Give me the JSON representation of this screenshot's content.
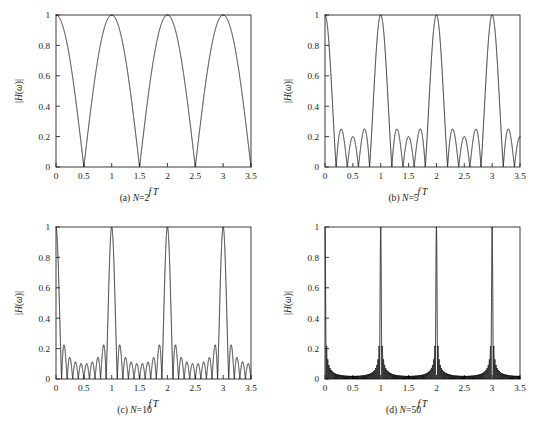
{
  "figure": {
    "panels": [
      {
        "id": "panel-a",
        "caption_prefix": "(a) ",
        "caption_symbol": "N",
        "caption_value": "=2",
        "N": 2
      },
      {
        "id": "panel-b",
        "caption_prefix": "(b) ",
        "caption_symbol": "N",
        "caption_value": "=5",
        "N": 5
      },
      {
        "id": "panel-c",
        "caption_prefix": "(c) ",
        "caption_symbol": "N",
        "caption_value": "=10",
        "N": 10
      },
      {
        "id": "panel-d",
        "caption_prefix": "(d) ",
        "caption_symbol": "N",
        "caption_value": "=50",
        "N": 50
      }
    ]
  },
  "axis": {
    "xlabel": "f T",
    "xlabel_f": "f",
    "xlabel_T": "T",
    "ylabel": "|H(ω)|",
    "ylabel_bar": "|",
    "ylabel_H": "H",
    "ylabel_paren_open": "(",
    "ylabel_omega": "ω",
    "ylabel_paren_close": ")",
    "xticks": [
      "0",
      "0.5",
      "1",
      "1.5",
      "2",
      "2.5",
      "3",
      "3.5"
    ],
    "yticks": [
      "0",
      "0.2",
      "0.4",
      "0.6",
      "0.8",
      "1"
    ]
  },
  "colors": {
    "background": "#ffffff",
    "curve": "#161616",
    "axis": "#262626",
    "text": "#1a1a1a"
  },
  "chart_data": [
    {
      "type": "line",
      "title": "(a) N=2",
      "xlabel": "f T",
      "ylabel": "|H(ω)|",
      "xlim": [
        0,
        3.5
      ],
      "ylim": [
        0,
        1
      ],
      "xticks": [
        0,
        0.5,
        1,
        1.5,
        2,
        2.5,
        3,
        3.5
      ],
      "yticks": [
        0,
        0.2,
        0.4,
        0.6,
        0.8,
        1
      ],
      "grid": false,
      "legend": null,
      "function": "|sin(N*pi*fT) / (N*sin(pi*fT))|",
      "N": 2,
      "nulls": [
        0.5,
        1.5,
        2.5,
        3.5
      ],
      "peaks": [
        {
          "x": 0,
          "y": 1
        },
        {
          "x": 1,
          "y": 1
        },
        {
          "x": 2,
          "y": 1
        },
        {
          "x": 3,
          "y": 1
        }
      ],
      "samples_x": [
        0,
        0.125,
        0.25,
        0.375,
        0.5,
        0.625,
        0.75,
        0.875,
        1,
        1.25,
        1.5,
        1.75,
        2,
        2.25,
        2.5,
        2.75,
        3,
        3.25,
        3.5
      ],
      "samples_y": [
        1,
        0.924,
        0.707,
        0.383,
        0,
        0.383,
        0.707,
        0.924,
        1,
        0.707,
        0,
        0.707,
        1,
        0.707,
        0,
        0.707,
        1,
        0.707,
        0
      ]
    },
    {
      "type": "line",
      "title": "(b) N=5",
      "xlabel": "f T",
      "ylabel": "|H(ω)|",
      "xlim": [
        0,
        3.5
      ],
      "ylim": [
        0,
        1
      ],
      "xticks": [
        0,
        0.5,
        1,
        1.5,
        2,
        2.5,
        3,
        3.5
      ],
      "yticks": [
        0,
        0.2,
        0.4,
        0.6,
        0.8,
        1
      ],
      "grid": false,
      "legend": null,
      "function": "|sin(N*pi*fT) / (N*sin(pi*fT))|",
      "N": 5,
      "nulls": [
        0.2,
        0.4,
        0.6,
        0.8,
        1.2,
        1.4,
        1.6,
        1.8,
        2.2,
        2.4,
        2.6,
        2.8,
        3.2,
        3.4
      ],
      "peaks": [
        {
          "x": 0,
          "y": 1
        },
        {
          "x": 1,
          "y": 1
        },
        {
          "x": 2,
          "y": 1
        },
        {
          "x": 3,
          "y": 1
        }
      ],
      "sidelobe_peak": 0.247
    },
    {
      "type": "line",
      "title": "(c) N=10",
      "xlabel": "f T",
      "ylabel": "|H(ω)|",
      "xlim": [
        0,
        3.5
      ],
      "ylim": [
        0,
        1
      ],
      "xticks": [
        0,
        0.5,
        1,
        1.5,
        2,
        2.5,
        3,
        3.5
      ],
      "yticks": [
        0,
        0.2,
        0.4,
        0.6,
        0.8,
        1
      ],
      "grid": false,
      "legend": null,
      "function": "|sin(N*pi*fT) / (N*sin(pi*fT))|",
      "N": 10,
      "peaks": [
        {
          "x": 0,
          "y": 1
        },
        {
          "x": 1,
          "y": 1
        },
        {
          "x": 2,
          "y": 1
        },
        {
          "x": 3,
          "y": 1
        }
      ],
      "sidelobe_peak": 0.217,
      "null_spacing": 0.1
    },
    {
      "type": "line",
      "title": "(d) N=50",
      "xlabel": "f T",
      "ylabel": "|H(ω)|",
      "xlim": [
        0,
        3.5
      ],
      "ylim": [
        0,
        1
      ],
      "xticks": [
        0,
        0.5,
        1,
        1.5,
        2,
        2.5,
        3,
        3.5
      ],
      "yticks": [
        0,
        0.2,
        0.4,
        0.6,
        0.8,
        1
      ],
      "grid": false,
      "legend": null,
      "function": "|sin(N*pi*fT) / (N*sin(pi*fT))|",
      "N": 50,
      "peaks": [
        {
          "x": 0,
          "y": 1
        },
        {
          "x": 1,
          "y": 1
        },
        {
          "x": 2,
          "y": 1
        },
        {
          "x": 3,
          "y": 1
        }
      ],
      "sidelobe_peak": 0.212,
      "null_spacing": 0.02
    }
  ]
}
